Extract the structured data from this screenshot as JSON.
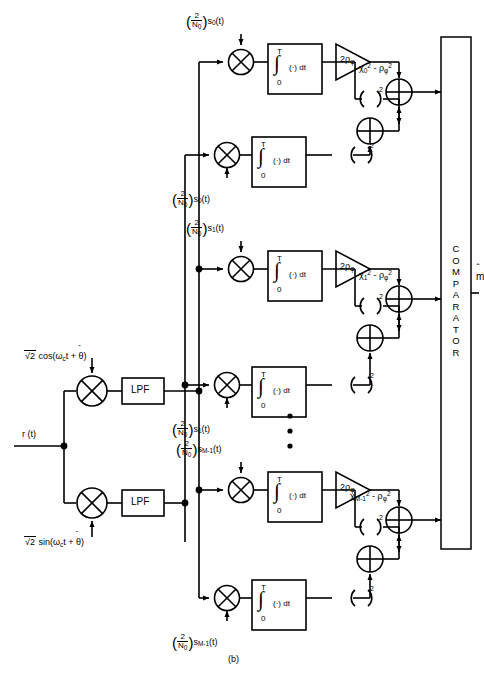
{
  "figure": {
    "caption": "(b)"
  },
  "input": {
    "signal_label": "r (t)",
    "carrier_cos": "√2 cos(ωc t + θ̂)",
    "carrier_sin": "√2 sin(ωc t + θ̂)"
  },
  "blocks": {
    "lpf_label": "LPF",
    "integrator": {
      "upper_limit": "T",
      "lower_limit": "0",
      "body": "(·) dt",
      "symbol": "∫"
    },
    "squarer_label": "(  )",
    "squarer_exponent": "2",
    "amplifier_gain_prefix": "2",
    "amplifier_gain_symbol": "ρ",
    "amplifier_gain_sub": "φ",
    "multiplier_symbol": "⊗",
    "adder_symbol": "⊕"
  },
  "reference_coeff": {
    "numerator": "2",
    "denominator": "N",
    "denominator_sub": "0"
  },
  "branches": [
    {
      "id": "branch-0",
      "signal_sub": "0",
      "signal_label": "s",
      "signal_arg": "(t)",
      "output_chi": "χ",
      "output_chi_sub": "0",
      "output_chi_sup": "2",
      "output_rho": "ρ",
      "output_rho_sub": "φ",
      "output_rho_sup": "2",
      "output_minus": "-"
    },
    {
      "id": "branch-1",
      "signal_sub": "1",
      "signal_label": "s",
      "signal_arg": "(t)",
      "output_chi": "χ",
      "output_chi_sub": "1",
      "output_chi_sup": "2",
      "output_rho": "ρ",
      "output_rho_sub": "φ",
      "output_rho_sup": "2",
      "output_minus": "-"
    },
    {
      "id": "branch-M1",
      "signal_sub": "M-1",
      "signal_label": "s",
      "signal_arg": "(t)",
      "output_chi": "χ",
      "output_chi_sub": "M-1",
      "output_chi_sup": "2",
      "output_rho": "ρ",
      "output_rho_sub": "φ",
      "output_rho_sup": "2",
      "output_minus": "-"
    }
  ],
  "comparator": {
    "label": "COMPARATOR",
    "letters": [
      "C",
      "O",
      "M",
      "P",
      "A",
      "R",
      "A",
      "T",
      "O",
      "R"
    ],
    "output_label": "m̂"
  },
  "ellipsis": {
    "dots": 3
  },
  "colors": {
    "stroke": "#000000",
    "background": "#ffffff"
  }
}
